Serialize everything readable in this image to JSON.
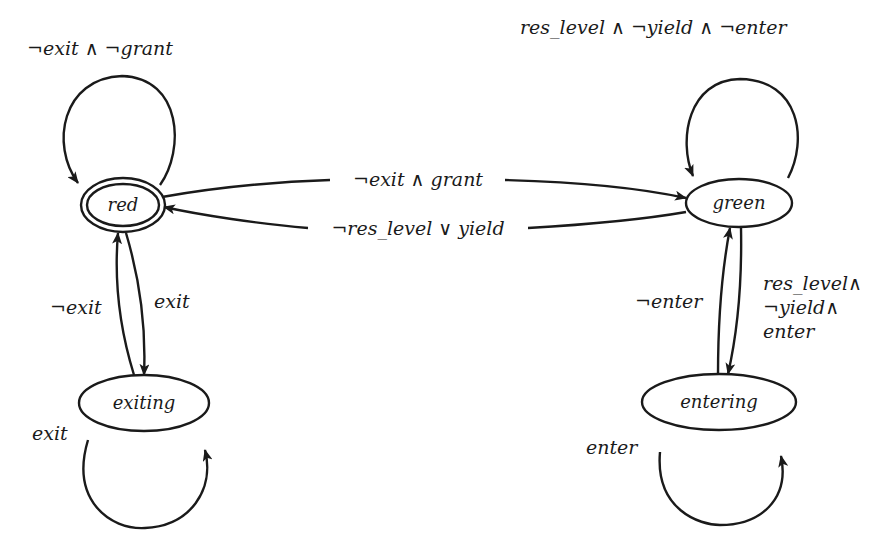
{
  "diagram": {
    "type": "state-machine",
    "states": [
      {
        "id": "red",
        "label": "red",
        "initial": true
      },
      {
        "id": "green",
        "label": "green"
      },
      {
        "id": "exiting",
        "label": "exiting"
      },
      {
        "id": "entering",
        "label": "entering"
      }
    ],
    "transitions": [
      {
        "from": "red",
        "to": "red",
        "label": "¬exit ∧ ¬grant"
      },
      {
        "from": "red",
        "to": "green",
        "label": "¬exit ∧ grant"
      },
      {
        "from": "green",
        "to": "red",
        "label": "¬res_level ∨ yield"
      },
      {
        "from": "green",
        "to": "green",
        "label": "res_level ∧ ¬yield ∧ ¬enter"
      },
      {
        "from": "red",
        "to": "exiting",
        "label": "exit"
      },
      {
        "from": "exiting",
        "to": "red",
        "label": "¬exit"
      },
      {
        "from": "exiting",
        "to": "exiting",
        "label": "exit"
      },
      {
        "from": "green",
        "to": "entering",
        "label_lines": [
          "res_level∧",
          "¬yield∧",
          "enter"
        ]
      },
      {
        "from": "entering",
        "to": "green",
        "label": "¬enter"
      },
      {
        "from": "entering",
        "to": "entering",
        "label": "enter"
      }
    ]
  }
}
